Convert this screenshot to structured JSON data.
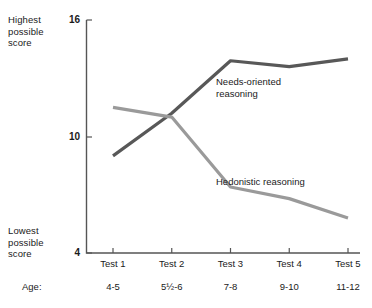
{
  "axis_captions": {
    "highest": "Highest\npossible\nscore",
    "lowest": "Lowest\npossible\nscore",
    "age_prefix": "Age:"
  },
  "chart_data": {
    "type": "line",
    "title": "",
    "xlabel": "",
    "ylabel": "",
    "ylim": [
      4,
      16
    ],
    "yticks": [
      16,
      10,
      4
    ],
    "ytick_labels": [
      "16",
      "10",
      "4"
    ],
    "grid": false,
    "legend_position": "inline-annotation",
    "categories": [
      "Test 1",
      "Test 2",
      "Test 3",
      "Test 4",
      "Test 5"
    ],
    "secondary_categories": [
      "4-5",
      "5½-6",
      "7-8",
      "9-10",
      "11-12"
    ],
    "series": [
      {
        "name": "Needs-oriented reasoning",
        "label": "Needs-oriented\nreasoning",
        "color": "#585858",
        "values": [
          9.0,
          11.2,
          13.9,
          13.6,
          14.0
        ]
      },
      {
        "name": "Hedonistic reasoning",
        "label": "Hedonistic reasoning",
        "color": "#9a9a9a",
        "values": [
          11.5,
          11.0,
          7.4,
          6.8,
          5.8
        ]
      }
    ]
  }
}
